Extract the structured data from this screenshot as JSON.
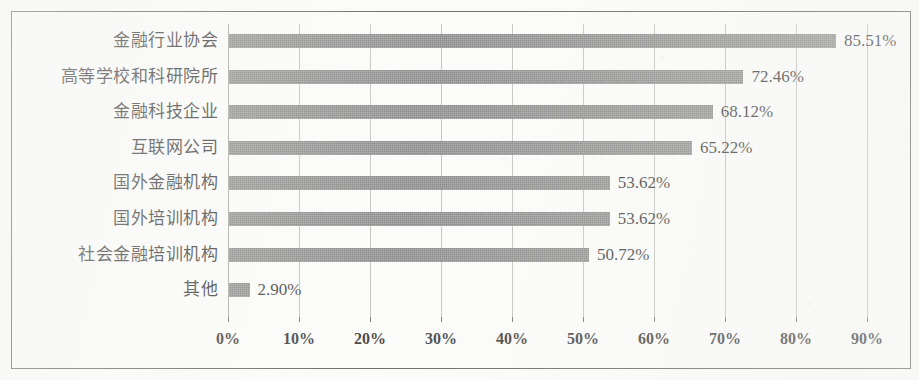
{
  "chart_data": {
    "type": "bar",
    "orientation": "horizontal",
    "title": "",
    "subtitle": "",
    "xlabel": "",
    "ylabel": "",
    "xlim": [
      0,
      90
    ],
    "grid": true,
    "legend": "none",
    "bar_color": "#6e6e6e",
    "categories": [
      "金融行业协会",
      "高等学校和科研院所",
      "金融科技企业",
      "互联网公司",
      "国外金融机构",
      "国外培训机构",
      "社会金融培训机构",
      "其他"
    ],
    "values": [
      85.51,
      72.46,
      68.12,
      65.22,
      53.62,
      53.62,
      50.72,
      2.9
    ],
    "value_labels": [
      "85.51%",
      "72.46%",
      "68.12%",
      "65.22%",
      "53.62%",
      "53.62%",
      "50.72%",
      "2.90%"
    ],
    "xticks": [
      0,
      10,
      20,
      30,
      40,
      50,
      60,
      70,
      80,
      90
    ],
    "xtick_labels": [
      "0%",
      "10%",
      "20%",
      "30%",
      "40%",
      "50%",
      "60%",
      "70%",
      "80%",
      "90%"
    ]
  }
}
